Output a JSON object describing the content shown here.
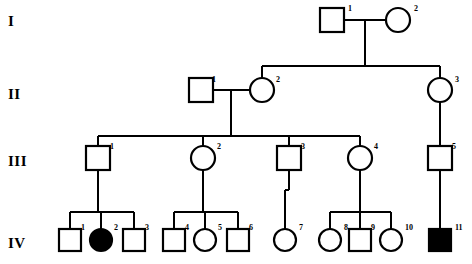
{
  "figure": {
    "type": "pedigree-chart",
    "width": 472,
    "height": 264,
    "background_color": "#ffffff",
    "line_color": "#000000",
    "affected_fill_color": "#000000",
    "unaffected_fill_color": "#ffffff"
  },
  "generation_labels": [
    {
      "id": "gen-I",
      "text": "I",
      "x": 8,
      "y": 14
    },
    {
      "id": "gen-II",
      "text": "II",
      "x": 8,
      "y": 87
    },
    {
      "id": "gen-III",
      "text": "III",
      "x": 8,
      "y": 154
    },
    {
      "id": "gen-IV",
      "text": "IV",
      "x": 8,
      "y": 236
    }
  ],
  "individuals": [
    {
      "key": "I-1",
      "generation": "I",
      "number": "1",
      "shape": "square",
      "affected": false,
      "cx": 332,
      "cy": 20,
      "size": 24,
      "num_x": 348,
      "num_y": 5
    },
    {
      "key": "I-2",
      "generation": "I",
      "number": "2",
      "shape": "circle",
      "affected": false,
      "cx": 398,
      "cy": 20,
      "size": 24,
      "num_x": 414,
      "num_y": 5
    },
    {
      "key": "II-1",
      "generation": "II",
      "number": "1",
      "shape": "square",
      "affected": false,
      "cx": 201,
      "cy": 90,
      "size": 24,
      "num_x": 212,
      "num_y": 76
    },
    {
      "key": "II-2",
      "generation": "II",
      "number": "2",
      "shape": "circle",
      "affected": false,
      "cx": 262,
      "cy": 90,
      "size": 24,
      "num_x": 276,
      "num_y": 76
    },
    {
      "key": "II-3",
      "generation": "II",
      "number": "3",
      "shape": "circle",
      "affected": false,
      "cx": 440,
      "cy": 90,
      "size": 24,
      "num_x": 455,
      "num_y": 76
    },
    {
      "key": "III-1",
      "generation": "III",
      "number": "1",
      "shape": "square",
      "affected": false,
      "cx": 98,
      "cy": 158,
      "size": 24,
      "num_x": 110,
      "num_y": 143
    },
    {
      "key": "III-2",
      "generation": "III",
      "number": "2",
      "shape": "circle",
      "affected": false,
      "cx": 203,
      "cy": 158,
      "size": 24,
      "num_x": 217,
      "num_y": 143
    },
    {
      "key": "III-3",
      "generation": "III",
      "number": "3",
      "shape": "square",
      "affected": false,
      "cx": 289,
      "cy": 158,
      "size": 24,
      "num_x": 301,
      "num_y": 143
    },
    {
      "key": "III-4",
      "generation": "III",
      "number": "4",
      "shape": "circle",
      "affected": false,
      "cx": 360,
      "cy": 158,
      "size": 24,
      "num_x": 374,
      "num_y": 143
    },
    {
      "key": "III-5",
      "generation": "III",
      "number": "5",
      "shape": "square",
      "affected": false,
      "cx": 440,
      "cy": 158,
      "size": 24,
      "num_x": 452,
      "num_y": 143
    },
    {
      "key": "IV-1",
      "generation": "IV",
      "number": "1",
      "shape": "square",
      "affected": false,
      "cx": 70,
      "cy": 240,
      "size": 22,
      "num_x": 81,
      "num_y": 224
    },
    {
      "key": "IV-2",
      "generation": "IV",
      "number": "2",
      "shape": "circle",
      "affected": true,
      "cx": 101,
      "cy": 240,
      "size": 22,
      "num_x": 114,
      "num_y": 224
    },
    {
      "key": "IV-3",
      "generation": "IV",
      "number": "3",
      "shape": "square",
      "affected": false,
      "cx": 134,
      "cy": 240,
      "size": 22,
      "num_x": 145,
      "num_y": 224
    },
    {
      "key": "IV-4",
      "generation": "IV",
      "number": "4",
      "shape": "square",
      "affected": false,
      "cx": 174,
      "cy": 240,
      "size": 22,
      "num_x": 185,
      "num_y": 224
    },
    {
      "key": "IV-5",
      "generation": "IV",
      "number": "5",
      "shape": "circle",
      "affected": false,
      "cx": 205,
      "cy": 240,
      "size": 22,
      "num_x": 218,
      "num_y": 224
    },
    {
      "key": "IV-6",
      "generation": "IV",
      "number": "6",
      "shape": "square",
      "affected": false,
      "cx": 238,
      "cy": 240,
      "size": 22,
      "num_x": 249,
      "num_y": 224
    },
    {
      "key": "IV-7",
      "generation": "IV",
      "number": "7",
      "shape": "circle",
      "affected": false,
      "cx": 285,
      "cy": 240,
      "size": 22,
      "num_x": 299,
      "num_y": 224
    },
    {
      "key": "IV-8",
      "generation": "IV",
      "number": "8",
      "shape": "circle",
      "affected": false,
      "cx": 330,
      "cy": 240,
      "size": 22,
      "num_x": 344,
      "num_y": 224
    },
    {
      "key": "IV-9",
      "generation": "IV",
      "number": "9",
      "shape": "square",
      "affected": false,
      "cx": 360,
      "cy": 240,
      "size": 22,
      "num_x": 371,
      "num_y": 224
    },
    {
      "key": "IV-10",
      "generation": "IV",
      "number": "10",
      "shape": "circle",
      "affected": false,
      "cx": 391,
      "cy": 240,
      "size": 22,
      "num_x": 405,
      "num_y": 224
    },
    {
      "key": "IV-11",
      "generation": "IV",
      "number": "11",
      "shape": "square",
      "affected": true,
      "cx": 440,
      "cy": 240,
      "size": 22,
      "num_x": 455,
      "num_y": 224
    }
  ],
  "lines": [
    {
      "id": "mate-I1-I2",
      "x1": 344,
      "y1": 20,
      "x2": 386,
      "y2": 20
    },
    {
      "id": "descent-I",
      "x1": 365,
      "y1": 20,
      "x2": 365,
      "y2": 66
    },
    {
      "id": "sibship-II",
      "x1": 262,
      "y1": 66,
      "x2": 440,
      "y2": 66
    },
    {
      "id": "drop-II2",
      "x1": 262,
      "y1": 66,
      "x2": 262,
      "y2": 78
    },
    {
      "id": "drop-II3",
      "x1": 440,
      "y1": 66,
      "x2": 440,
      "y2": 78
    },
    {
      "id": "mate-II1-II2",
      "x1": 213,
      "y1": 90,
      "x2": 250,
      "y2": 90
    },
    {
      "id": "descent-II",
      "x1": 231,
      "y1": 90,
      "x2": 231,
      "y2": 136
    },
    {
      "id": "sibship-III",
      "x1": 98,
      "y1": 136,
      "x2": 360,
      "y2": 136
    },
    {
      "id": "drop-III1",
      "x1": 98,
      "y1": 136,
      "x2": 98,
      "y2": 146
    },
    {
      "id": "drop-III2",
      "x1": 203,
      "y1": 136,
      "x2": 203,
      "y2": 146
    },
    {
      "id": "drop-III3",
      "x1": 289,
      "y1": 136,
      "x2": 289,
      "y2": 146
    },
    {
      "id": "drop-III4",
      "x1": 360,
      "y1": 136,
      "x2": 360,
      "y2": 146
    },
    {
      "id": "descent-II3",
      "x1": 440,
      "y1": 102,
      "x2": 440,
      "y2": 146
    },
    {
      "id": "descent-III1",
      "x1": 98,
      "y1": 170,
      "x2": 98,
      "y2": 212
    },
    {
      "id": "sibship-IV-a",
      "x1": 70,
      "y1": 212,
      "x2": 134,
      "y2": 212
    },
    {
      "id": "drop-IV1",
      "x1": 70,
      "y1": 212,
      "x2": 70,
      "y2": 229
    },
    {
      "id": "drop-IV2",
      "x1": 101,
      "y1": 212,
      "x2": 101,
      "y2": 229
    },
    {
      "id": "drop-IV3",
      "x1": 134,
      "y1": 212,
      "x2": 134,
      "y2": 229
    },
    {
      "id": "descent-III2",
      "x1": 203,
      "y1": 170,
      "x2": 203,
      "y2": 212
    },
    {
      "id": "sibship-IV-b",
      "x1": 174,
      "y1": 212,
      "x2": 238,
      "y2": 212
    },
    {
      "id": "drop-IV4",
      "x1": 174,
      "y1": 212,
      "x2": 174,
      "y2": 229
    },
    {
      "id": "drop-IV5",
      "x1": 205,
      "y1": 212,
      "x2": 205,
      "y2": 229
    },
    {
      "id": "drop-IV6",
      "x1": 238,
      "y1": 212,
      "x2": 238,
      "y2": 229
    },
    {
      "id": "descent-III3",
      "x1": 289,
      "y1": 170,
      "x2": 289,
      "y2": 190
    },
    {
      "id": "link-IV7",
      "x1": 285,
      "y1": 190,
      "x2": 285,
      "y2": 229
    },
    {
      "id": "link-IV7-h",
      "x1": 285,
      "y1": 190,
      "x2": 289,
      "y2": 190
    },
    {
      "id": "descent-III4",
      "x1": 360,
      "y1": 170,
      "x2": 360,
      "y2": 212
    },
    {
      "id": "sibship-IV-c",
      "x1": 330,
      "y1": 212,
      "x2": 391,
      "y2": 212
    },
    {
      "id": "drop-IV8",
      "x1": 330,
      "y1": 212,
      "x2": 330,
      "y2": 229
    },
    {
      "id": "drop-IV9",
      "x1": 360,
      "y1": 212,
      "x2": 360,
      "y2": 229
    },
    {
      "id": "drop-IV10",
      "x1": 391,
      "y1": 212,
      "x2": 391,
      "y2": 229
    },
    {
      "id": "descent-III5",
      "x1": 440,
      "y1": 170,
      "x2": 440,
      "y2": 229
    }
  ],
  "chart_data": {
    "type": "diagram",
    "title": "",
    "generations": [
      "I",
      "II",
      "III",
      "IV"
    ],
    "counts_per_generation": {
      "I": 2,
      "II": 3,
      "III": 5,
      "IV": 11
    },
    "affected_members": [
      "IV-2",
      "IV-11"
    ],
    "symbol_legend": {
      "square": "male",
      "circle": "female",
      "filled": "affected",
      "open": "unaffected"
    },
    "relationships": [
      {
        "type": "mating",
        "partners": [
          "I-1",
          "I-2"
        ],
        "children": [
          "II-2",
          "II-3"
        ]
      },
      {
        "type": "mating",
        "partners": [
          "II-1",
          "II-2"
        ],
        "children": [
          "III-1",
          "III-2",
          "III-3",
          "III-4"
        ]
      },
      {
        "type": "single-parent",
        "parent": "II-3",
        "children": [
          "III-5"
        ]
      },
      {
        "type": "single-parent",
        "parent": "III-1",
        "children": [
          "IV-1",
          "IV-2",
          "IV-3"
        ]
      },
      {
        "type": "single-parent",
        "parent": "III-2",
        "children": [
          "IV-4",
          "IV-5",
          "IV-6"
        ]
      },
      {
        "type": "single-parent",
        "parent": "III-3",
        "children": [
          "IV-7"
        ]
      },
      {
        "type": "single-parent",
        "parent": "III-4",
        "children": [
          "IV-8",
          "IV-9",
          "IV-10"
        ]
      },
      {
        "type": "single-parent",
        "parent": "III-5",
        "children": [
          "IV-11"
        ]
      }
    ]
  }
}
